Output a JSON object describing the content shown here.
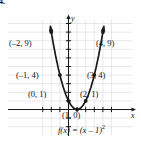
{
  "figure": {
    "corner_label": "4.",
    "axis_x_name": "x",
    "axis_y_name": "y",
    "function_label": {
      "lhs": "f(x) = (x – 1)",
      "exponent": "2"
    }
  },
  "colors": {
    "curve": "#1a1a1a",
    "axis": "#1a1a1a",
    "grid": "#d8d8d8",
    "text": "#111111",
    "background": "#ffffff"
  },
  "point_labels": [
    {
      "text": "(–2, 9)",
      "x": 9,
      "y": 39
    },
    {
      "text": "(4, 9)",
      "x": 96,
      "y": 39
    },
    {
      "text": "(–1, 4)",
      "x": 16,
      "y": 71
    },
    {
      "text": "(3, 4)",
      "x": 87,
      "y": 71
    },
    {
      "text": "(0, 1)",
      "x": 28,
      "y": 90
    },
    {
      "text": "(2, 1)",
      "x": 80,
      "y": 90
    },
    {
      "text": "(1, 0)",
      "x": 62,
      "y": 111
    }
  ],
  "chart_data": {
    "type": "line",
    "title": "",
    "subtitle": "",
    "xlabel": "x",
    "ylabel": "y",
    "equation": "f(x) = (x - 1)^2",
    "grid": true,
    "legend": "none",
    "xlim": [
      -3.4,
      5.4
    ],
    "ylim": [
      -2.2,
      10.6
    ],
    "x_tick_step": 1,
    "y_tick_step": 1,
    "tick_labels_shown": false,
    "series": [
      {
        "name": "f(x) = (x - 1)^2",
        "type": "curve",
        "color": "#1a1a1a",
        "arrow_start": true,
        "arrow_end": true,
        "x": [
          -2.1,
          -1.8,
          -1.5,
          -1.2,
          -0.9,
          -0.6,
          -0.3,
          0,
          0.3,
          0.6,
          0.9,
          1,
          1.1,
          1.4,
          1.7,
          2,
          2.3,
          2.6,
          2.9,
          3.2,
          3.5,
          3.8,
          4.1
        ],
        "y": [
          9.61,
          7.84,
          6.25,
          4.84,
          3.61,
          2.56,
          1.69,
          1,
          0.49,
          0.16,
          0.01,
          0,
          0.01,
          0.16,
          0.49,
          1,
          1.69,
          2.56,
          3.61,
          4.84,
          6.25,
          7.84,
          9.61
        ]
      }
    ],
    "points": [
      {
        "label": "(–2, 9)",
        "x": -2,
        "y": 9
      },
      {
        "label": "(–1, 4)",
        "x": -1,
        "y": 4
      },
      {
        "label": "(0, 1)",
        "x": 0,
        "y": 1
      },
      {
        "label": "(1, 0)",
        "x": 1,
        "y": 0,
        "vertex": true
      },
      {
        "label": "(2, 1)",
        "x": 2,
        "y": 1
      },
      {
        "label": "(3, 4)",
        "x": 3,
        "y": 4
      },
      {
        "label": "(4, 9)",
        "x": 4,
        "y": 9
      }
    ]
  }
}
